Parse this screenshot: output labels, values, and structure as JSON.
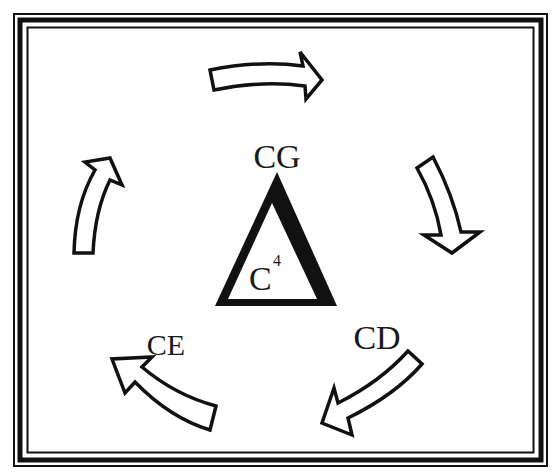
{
  "diagram": {
    "type": "cycle",
    "center": {
      "shape": "triangle",
      "label": "C",
      "superscript": "4"
    },
    "nodes": [
      {
        "id": "cg",
        "label": "CG",
        "position": "top"
      },
      {
        "id": "cd",
        "label": "CD",
        "position": "bottom-right"
      },
      {
        "id": "ce",
        "label": "CE",
        "position": "bottom-left"
      }
    ],
    "arrows": [
      {
        "id": "arrow-top",
        "direction": "right"
      },
      {
        "id": "arrow-right",
        "direction": "down"
      },
      {
        "id": "arrow-bottom-right",
        "direction": "down-left"
      },
      {
        "id": "arrow-bottom-left",
        "direction": "up-left"
      },
      {
        "id": "arrow-left",
        "direction": "up"
      }
    ],
    "colors": {
      "stroke": "#111111",
      "fill": "#ffffff"
    }
  }
}
